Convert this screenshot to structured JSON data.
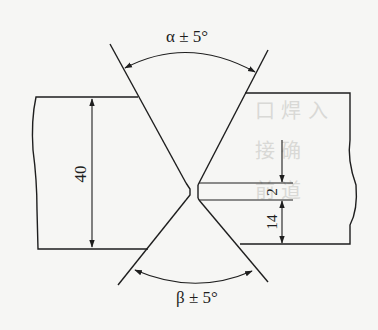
{
  "diagram": {
    "type": "double V-groove weld joint cross-section",
    "labels": {
      "top_angle": "α ± 5°",
      "bottom_angle": "β ± 5°",
      "plate_thickness": "40",
      "root_face": "2",
      "lower_groove_depth": "14"
    },
    "colors": {
      "line": "#1e1e1e",
      "background": "#f6f6f4"
    }
  }
}
